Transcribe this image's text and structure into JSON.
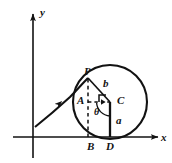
{
  "figure": {
    "stroke_color": "#121212",
    "background_color": "#ffffff",
    "axes": {
      "x_axis_label": "x",
      "y_axis_label": "y",
      "x_axis_y_px": 137,
      "y_axis_x_px": 33,
      "arrowheads": "both"
    },
    "circle": {
      "center_label": "C",
      "center_px": [
        110,
        102
      ],
      "radius_px": 37,
      "tangent_point_label": "D"
    },
    "points": [
      {
        "name": "P",
        "label": "P",
        "px": [
          88,
          78
        ],
        "desc": "tracing point on rolling circle"
      },
      {
        "name": "A",
        "label": "A",
        "px": [
          88,
          102
        ],
        "desc": "foot of perpendicular from P onto horizontal through C"
      },
      {
        "name": "C",
        "label": "C",
        "px": [
          110,
          102
        ],
        "desc": "center of circle"
      },
      {
        "name": "B",
        "label": "B",
        "px": [
          88,
          137
        ],
        "desc": "projection of P onto x-axis"
      },
      {
        "name": "D",
        "label": "D",
        "px": [
          110,
          137
        ],
        "desc": "contact point of circle with x-axis"
      }
    ],
    "segments": [
      {
        "name": "b",
        "label": "b",
        "from": "P",
        "to": "C",
        "desc": "distance from center to tracing point"
      },
      {
        "name": "a",
        "label": "a",
        "from": "C",
        "to": "D",
        "desc": "radius, circle height above x-axis"
      }
    ],
    "angle": {
      "label": "θ",
      "vertex": "C",
      "desc": "angle of rotation measured at the circle center"
    },
    "curve": {
      "name": "trochoid-arc",
      "desc": "traced curve rising from the y-axis to P",
      "direction_marker": "arrow",
      "arrow_px": [
        58,
        105
      ]
    },
    "right_angle_marker": {
      "at": "A",
      "desc": "small square indicating PA perpendicular to AC"
    }
  }
}
